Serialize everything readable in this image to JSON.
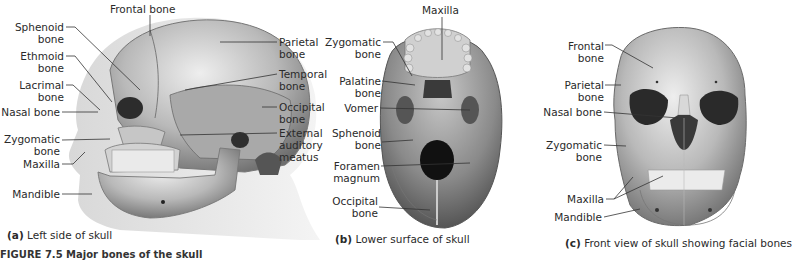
{
  "panels": {
    "a": {
      "caption_letter": "(a)",
      "caption_text": "Left side of skull",
      "labels": {
        "frontal": "Frontal bone",
        "sphenoid_1": "Sphenoid",
        "sphenoid_2": "bone",
        "ethmoid_1": "Ethmoid",
        "ethmoid_2": "bone",
        "lacrimal_1": "Lacrimal",
        "lacrimal_2": "bone",
        "nasal": "Nasal bone",
        "zygomatic_1": "Zygomatic",
        "zygomatic_2": "bone",
        "maxilla": "Maxilla",
        "mandible": "Mandible",
        "parietal_1": "Parietal",
        "parietal_2": "bone",
        "temporal_1": "Temporal",
        "temporal_2": "bone",
        "occipital_1": "Occipital",
        "occipital_2": "bone",
        "eam_1": "External",
        "eam_2": "auditory",
        "eam_3": "meatus"
      }
    },
    "b": {
      "caption_letter": "(b)",
      "caption_text": "Lower surface of skull",
      "labels": {
        "maxilla": "Maxilla",
        "zygomatic_1": "Zygomatic",
        "zygomatic_2": "bone",
        "palatine_1": "Palatine",
        "palatine_2": "bone",
        "vomer": "Vomer",
        "sphenoid_1": "Sphenoid",
        "sphenoid_2": "bone",
        "foramen_1": "Foramen",
        "foramen_2": "magnum",
        "occipital_1": "Occipital",
        "occipital_2": "bone"
      }
    },
    "c": {
      "caption_letter": "(c)",
      "caption_text": "Front view of skull showing facial bones",
      "labels": {
        "frontal_1": "Frontal",
        "frontal_2": "bone",
        "parietal_1": "Parietal",
        "parietal_2": "bone",
        "nasal": "Nasal bone",
        "zygomatic_1": "Zygomatic",
        "zygomatic_2": "bone",
        "maxilla": "Maxilla",
        "mandible": "Mandible"
      }
    }
  },
  "figure_caption": "FIGURE 7.5 Major bones of the skull"
}
